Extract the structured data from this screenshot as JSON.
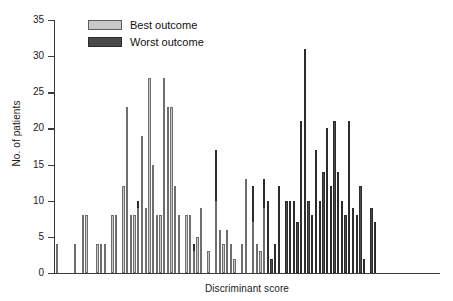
{
  "chart_data": {
    "type": "bar",
    "title": "",
    "xlabel": "Discriminant score",
    "ylabel": "No. of patients",
    "ylim": [
      0,
      35
    ],
    "yticks": [
      0,
      5,
      10,
      15,
      20,
      25,
      30,
      35
    ],
    "ytick_labels": [
      "0",
      "5",
      "10",
      "15",
      "20",
      "25",
      "30",
      "35"
    ],
    "grid": false,
    "legend_position": "top-left",
    "stacked": true,
    "xtick_labels": [],
    "colors": {
      "best": "#c8c8c8",
      "worst": "#4a4a4a",
      "axis": "#3b3b3b",
      "text": "#1a1a1a"
    },
    "series": [
      {
        "name": "Best outcome",
        "values": [
          4,
          0,
          0,
          0,
          0,
          4,
          0,
          8,
          8,
          0,
          0,
          4,
          4,
          4,
          0,
          8,
          8,
          0,
          12,
          23,
          8,
          8,
          9,
          19,
          9,
          27,
          15,
          8,
          8,
          27,
          23,
          23,
          12,
          8,
          0,
          8,
          8,
          3,
          5,
          9,
          0,
          3,
          0,
          10,
          6,
          4,
          6,
          4,
          2,
          0,
          4,
          13,
          0,
          7,
          4,
          3,
          9,
          0,
          0,
          0,
          0,
          0,
          0,
          0,
          0,
          0,
          0,
          0,
          0,
          0,
          0,
          0,
          0,
          0,
          0,
          0,
          0,
          0,
          0,
          0,
          0,
          0,
          0,
          0,
          0,
          0,
          0,
          0,
          0,
          0,
          0,
          0,
          0,
          0,
          0,
          0,
          0,
          0,
          0,
          0,
          0,
          0,
          0,
          0
        ]
      },
      {
        "name": "Worst outcome",
        "values": [
          0,
          0,
          0,
          0,
          0,
          0,
          0,
          0,
          0,
          0,
          0,
          0,
          0,
          0,
          0,
          0,
          0,
          0,
          0,
          0,
          0,
          0,
          1,
          0,
          0,
          0,
          0,
          0,
          0,
          0,
          0,
          0,
          0,
          0,
          0,
          0,
          0,
          1,
          0,
          0,
          0,
          0,
          0,
          7,
          0,
          0,
          0,
          0,
          0,
          0,
          0,
          0,
          0,
          5,
          0,
          0,
          4,
          10,
          2,
          4,
          12,
          0,
          10,
          10,
          10,
          7,
          21,
          31,
          10,
          8,
          17,
          10,
          14,
          20,
          12,
          21,
          14,
          10,
          8,
          21,
          9,
          8,
          12,
          2,
          0,
          9,
          7,
          0,
          0,
          0,
          0,
          0,
          0,
          0,
          0,
          0,
          0,
          0,
          0,
          0,
          0,
          0,
          0,
          0
        ]
      }
    ]
  },
  "legend": {
    "items": [
      {
        "label": "Best outcome",
        "key": "best"
      },
      {
        "label": "Worst outcome",
        "key": "worst"
      }
    ]
  }
}
